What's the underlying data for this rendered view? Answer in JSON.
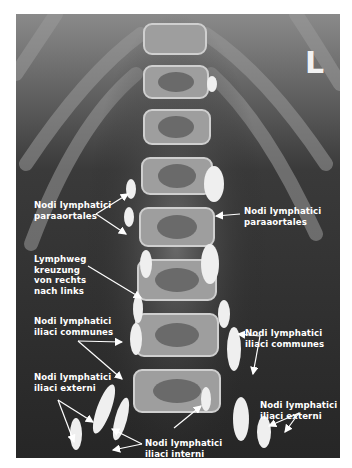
{
  "figure": {
    "type": "lymphangiography-xray",
    "side_marker": "L",
    "labels": {
      "paraaortales_left": "Nodi lymphatici\nparaaortales",
      "paraaortales_right": "Nodi lymphatici\nparaaortales",
      "lymphweg": "Lymphweg\nkreuzung\nvon rechts\nnach links",
      "iliaci_communes_left": "Nodi lymphatici\niliaci communes",
      "iliaci_communes_right": "Nodi lymphatici\niliaci communes",
      "iliaci_externi_left": "Nodi lymphatici\niliaci externi",
      "iliaci_externi_right": "Nodi lymphatici\niliaci externi",
      "iliaci_interni": "Nodi lymphatici\niliaci interni"
    },
    "colors": {
      "background": "#ffffff",
      "film_dark": "#2a2a2a",
      "bone": "#b8b8b8",
      "contrast": "#f0f0f0",
      "label_text": "#ffffff"
    }
  }
}
